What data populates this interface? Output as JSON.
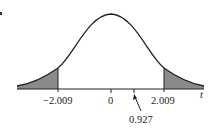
{
  "diagram": {
    "type": "t-distribution density curve",
    "axis_label": "t",
    "tick_labels": {
      "left_critical": "−2.009",
      "center": "0",
      "right_critical": "2.009",
      "test_statistic": "0.927"
    },
    "shaded_regions": [
      "left tail below -2.009",
      "right tail above 2.009"
    ],
    "colors": {
      "curve": "#222222",
      "shade": "#8a8a8a",
      "axis": "#222222"
    }
  }
}
